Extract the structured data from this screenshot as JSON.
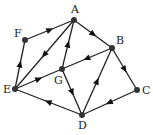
{
  "diagram": {
    "type": "directed-graph",
    "nodes": [
      {
        "id": "A",
        "label": "A",
        "x": 74,
        "y": 20,
        "lx": 71,
        "ly": 13
      },
      {
        "id": "B",
        "label": "B",
        "x": 112,
        "y": 48,
        "lx": 116,
        "ly": 44
      },
      {
        "id": "C",
        "label": "C",
        "x": 137,
        "y": 90,
        "lx": 142,
        "ly": 94
      },
      {
        "id": "D",
        "label": "D",
        "x": 82,
        "y": 115,
        "lx": 78,
        "ly": 129
      },
      {
        "id": "E",
        "label": "E",
        "x": 15,
        "y": 89,
        "lx": 3,
        "ly": 93
      },
      {
        "id": "F",
        "label": "F",
        "x": 25,
        "y": 40,
        "lx": 14,
        "ly": 37
      },
      {
        "id": "G",
        "label": "G",
        "x": 62,
        "y": 69,
        "lx": 54,
        "ly": 84
      }
    ],
    "edges": [
      {
        "from": "F",
        "to": "A"
      },
      {
        "from": "A",
        "to": "E"
      },
      {
        "from": "G",
        "to": "A"
      },
      {
        "from": "A",
        "to": "B"
      },
      {
        "from": "B",
        "to": "G"
      },
      {
        "from": "B",
        "to": "C"
      },
      {
        "from": "E",
        "to": "F"
      },
      {
        "from": "E",
        "to": "G"
      },
      {
        "from": "G",
        "to": "D"
      },
      {
        "from": "D",
        "to": "B"
      },
      {
        "from": "C",
        "to": "D"
      },
      {
        "from": "D",
        "to": "E"
      }
    ]
  }
}
